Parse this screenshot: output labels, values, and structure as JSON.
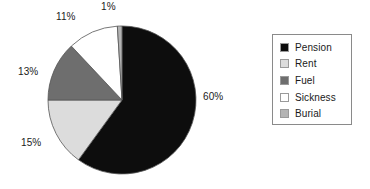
{
  "chart_data": {
    "type": "pie",
    "title": "",
    "subtitle": "",
    "xlabel": "",
    "ylabel": "",
    "legend_position": "right",
    "grid": false,
    "start_angle_deg": 0,
    "direction": "clockwise",
    "categories": [
      "Pension",
      "Rent",
      "Fuel",
      "Sickness",
      "Burial"
    ],
    "values": [
      60,
      15,
      13,
      11,
      1
    ],
    "value_unit": "%",
    "data_labels": [
      "60%",
      "15%",
      "13%",
      "11%",
      "1%"
    ],
    "colors": [
      "#0d0d0d",
      "#dcdcdc",
      "#6e6e6e",
      "#ffffff",
      "#b4b4b4"
    ],
    "slices": [
      {
        "label": "Pension",
        "value": 60,
        "data_label": "60%",
        "color": "#0d0d0d"
      },
      {
        "label": "Rent",
        "value": 15,
        "data_label": "15%",
        "color": "#dcdcdc"
      },
      {
        "label": "Fuel",
        "value": 13,
        "data_label": "13%",
        "color": "#6e6e6e"
      },
      {
        "label": "Sickness",
        "value": 11,
        "data_label": "11%",
        "color": "#ffffff"
      },
      {
        "label": "Burial",
        "value": 1,
        "data_label": "1%",
        "color": "#b4b4b4"
      }
    ]
  },
  "legend": {
    "items": [
      {
        "label": "Pension",
        "swatch_color": "#0d0d0d"
      },
      {
        "label": "Rent",
        "swatch_color": "#dcdcdc"
      },
      {
        "label": "Fuel",
        "swatch_color": "#6e6e6e"
      },
      {
        "label": "Sickness",
        "swatch_color": "#ffffff"
      },
      {
        "label": "Burial",
        "swatch_color": "#b4b4b4"
      }
    ]
  },
  "labels": {
    "pension": "60%",
    "rent": "15%",
    "fuel": "13%",
    "sickness": "11%",
    "burial": "1%"
  },
  "style": {
    "background": "#ffffff",
    "outline": "#8a8a8a",
    "text": "#1a1a1a"
  }
}
